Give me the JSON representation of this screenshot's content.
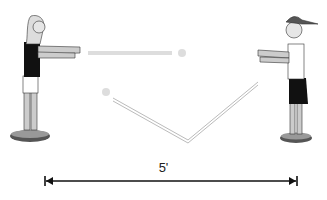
{
  "diagram": {
    "type": "ball-passing-drill",
    "players": [
      {
        "id": "left",
        "description": "girl in dark shirt, arms extended, standing on disc"
      },
      {
        "id": "right",
        "description": "boy in cap, white shirt, dark shorts, arms extended, standing on disc"
      }
    ],
    "passes": [
      {
        "type": "chest-pass",
        "description": "straight pass between players"
      },
      {
        "type": "bounce-pass",
        "description": "V-shaped bounce pass"
      }
    ],
    "distance_label": "5'",
    "colors": {
      "line": "#111111",
      "pass_trail": "#bbbbbb",
      "shirt_dark": "#111111",
      "skin": "#d8d8d8",
      "disc": "#444444"
    }
  }
}
